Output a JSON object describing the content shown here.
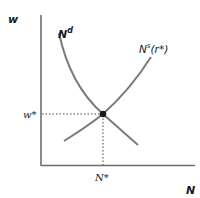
{
  "diagram": {
    "type": "labor-market-equilibrium",
    "axes": {
      "y_label": "w",
      "x_label": "N"
    },
    "curves": [
      {
        "name": "labor-demand",
        "label_main": "N",
        "label_sup": "d"
      },
      {
        "name": "labor-supply",
        "label_main": "N",
        "label_sup": "s",
        "label_suffix": "(r*)"
      }
    ],
    "equilibrium": {
      "w_label": "w*",
      "n_label": "N*"
    },
    "colors": {
      "axis": "#6e6e6e",
      "curve": "#7a7a7a",
      "dotted": "#444444",
      "point": "#1a1a1a",
      "text": "#1a1a1a"
    }
  }
}
